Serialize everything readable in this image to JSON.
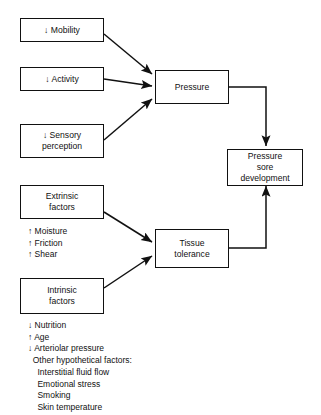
{
  "diagram": {
    "line_color": "#111111",
    "background": "#ffffff",
    "nodes": {
      "mobility": {
        "label": "↓ Mobility"
      },
      "activity": {
        "label": "↓ Activity"
      },
      "sensory": {
        "label": "↓ Sensory\nperception"
      },
      "pressure": {
        "label": "Pressure"
      },
      "pressure_sore": {
        "label": "Pressure\nsore\ndevelopment"
      },
      "extrinsic": {
        "label": "Extrinsic\nfactors"
      },
      "intrinsic": {
        "label": "Intrinsic\nfactors"
      },
      "tissue_tolerance": {
        "label": "Tissue\ntolerance"
      }
    },
    "extrinsic_list": "↑ Moisture\n↑ Friction\n↑ Shear",
    "intrinsic_list": "↓ Nutrition\n↑ Age\n↓ Arteriolar pressure\n  Other hypothetical factors:\n    Interstitial fluid flow\n    Emotional stress\n    Smoking\n    Skin temperature",
    "edges": [
      {
        "name": "mobility-to-pressure",
        "from": "mobility",
        "to": "pressure",
        "style": "diagonal-arrow"
      },
      {
        "name": "activity-to-pressure",
        "from": "activity",
        "to": "pressure",
        "style": "straight-arrow"
      },
      {
        "name": "sensory-to-pressure",
        "from": "sensory",
        "to": "pressure",
        "style": "diagonal-arrow"
      },
      {
        "name": "pressure-to-pressure-sore",
        "from": "pressure",
        "to": "pressure_sore",
        "style": "orthogonal-arrow"
      },
      {
        "name": "extrinsic-to-tissue-tolerance",
        "from": "extrinsic",
        "to": "tissue_tolerance",
        "style": "diagonal-arrow"
      },
      {
        "name": "intrinsic-to-tissue-tolerance",
        "from": "intrinsic",
        "to": "tissue_tolerance",
        "style": "diagonal-arrow"
      },
      {
        "name": "tissue-tolerance-to-pressure-sore",
        "from": "tissue_tolerance",
        "to": "pressure_sore",
        "style": "orthogonal-arrow"
      }
    ]
  }
}
